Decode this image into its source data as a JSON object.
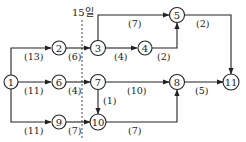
{
  "diagram": {
    "type": "activity-network",
    "milestone": {
      "label": "15일",
      "x": 82
    },
    "nodes": [
      {
        "id": "1",
        "label": "1",
        "x": 11,
        "y": 82
      },
      {
        "id": "2",
        "label": "2",
        "x": 59,
        "y": 48
      },
      {
        "id": "3",
        "label": "3",
        "x": 98,
        "y": 48
      },
      {
        "id": "4",
        "label": "4",
        "x": 145,
        "y": 48
      },
      {
        "id": "5",
        "label": "5",
        "x": 177,
        "y": 15
      },
      {
        "id": "6",
        "label": "6",
        "x": 59,
        "y": 82
      },
      {
        "id": "7",
        "label": "7",
        "x": 98,
        "y": 82
      },
      {
        "id": "8",
        "label": "8",
        "x": 177,
        "y": 82
      },
      {
        "id": "9",
        "label": "9",
        "x": 59,
        "y": 122
      },
      {
        "id": "10",
        "label": "10",
        "x": 98,
        "y": 122
      },
      {
        "id": "11",
        "label": "11",
        "x": 231,
        "y": 82
      }
    ],
    "edges": [
      {
        "from": "1",
        "to": "2",
        "duration": "(13)"
      },
      {
        "from": "1",
        "to": "6",
        "duration": "(11)"
      },
      {
        "from": "1",
        "to": "9",
        "duration": "(11)"
      },
      {
        "from": "2",
        "to": "3",
        "duration": "(6)"
      },
      {
        "from": "3",
        "to": "5",
        "duration": "(7)"
      },
      {
        "from": "3",
        "to": "4",
        "duration": "(4)"
      },
      {
        "from": "4",
        "to": "5",
        "duration": "(2)"
      },
      {
        "from": "5",
        "to": "11",
        "duration": "(2)"
      },
      {
        "from": "6",
        "to": "7",
        "duration": "(4)"
      },
      {
        "from": "7",
        "to": "8",
        "duration": "(10)"
      },
      {
        "from": "7",
        "to": "10",
        "duration": "(1)"
      },
      {
        "from": "8",
        "to": "11",
        "duration": "(5)"
      },
      {
        "from": "9",
        "to": "10",
        "duration": "(7)"
      },
      {
        "from": "10",
        "to": "8",
        "duration": "(7)"
      }
    ]
  }
}
